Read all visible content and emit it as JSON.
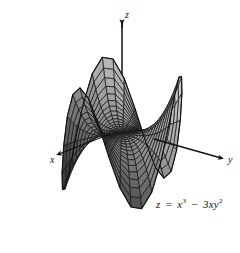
{
  "figure": {
    "kind": "3d-surface-plot",
    "background_color": "#ffffff",
    "width": 240,
    "height": 253,
    "equation_text": "z = x³ − 3xy²",
    "equation_parts": {
      "lhs": "z",
      "equals": "=",
      "term1_base": "x",
      "term1_exp": "3",
      "minus": "−",
      "term2_coeff": "3",
      "term2_vars": "xy",
      "term2_exp": "2"
    }
  },
  "axes": {
    "z": {
      "label": "z",
      "direction": "up"
    },
    "y": {
      "label": "y",
      "direction": "right-down"
    },
    "x": {
      "label": "x",
      "direction": "left-down"
    },
    "line_color": "#111111",
    "arrowheads": true
  },
  "chart_data": {
    "type": "surface",
    "title": "",
    "subtitle": "",
    "xlabel": "x",
    "ylabel": "y",
    "zlabel": "z",
    "equation": "z = x^3 - 3xy^2",
    "surface_name": "monkey saddle",
    "grid": true,
    "legend": "none",
    "mesh": {
      "u_lines": 17,
      "v_lines": 17,
      "style": "wireframe-with-shaded-faces",
      "line_color": "#1a1a1a",
      "face_color_light": "#c9c9c9",
      "face_color_mid": "#8f8f8f",
      "face_color_dark": "#3a3a3a"
    },
    "domain": {
      "r_min": 0,
      "r_max": 1.05,
      "theta_min": 0,
      "theta_max": 6.2831853
    },
    "zlim": [
      -1.05,
      1.05
    ],
    "lobes": {
      "up": 3,
      "down": 3
    },
    "projection": {
      "type": "oblique",
      "elev_deg": 22,
      "azim_deg": -58
    },
    "annotations": [
      {
        "text": "z = x³ − 3xy²",
        "x": 158,
        "y": 205
      }
    ]
  }
}
